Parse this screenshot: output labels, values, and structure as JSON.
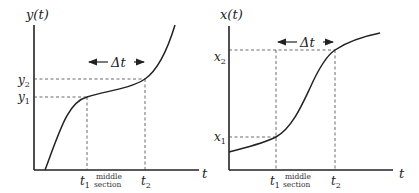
{
  "panels": [
    {
      "id": "left",
      "y_label": "y(t)",
      "x_label": "t",
      "level_labels": {
        "upper": "y",
        "upper_sub": "2",
        "lower": "y",
        "lower_sub": "1"
      },
      "time_labels": {
        "first": "t",
        "first_sub": "1",
        "second": "t",
        "second_sub": "2"
      },
      "middle_label_line1": "middle",
      "middle_label_line2": "section",
      "delta_label": "Δt"
    },
    {
      "id": "right",
      "y_label": "x(t)",
      "x_label": "t",
      "level_labels": {
        "upper": "x",
        "upper_sub": "2",
        "lower": "x",
        "lower_sub": "1"
      },
      "time_labels": {
        "first": "t",
        "first_sub": "1",
        "second": "t",
        "second_sub": "2"
      },
      "middle_label_line1": "middle",
      "middle_label_line2": "section",
      "delta_label": "Δt"
    }
  ]
}
